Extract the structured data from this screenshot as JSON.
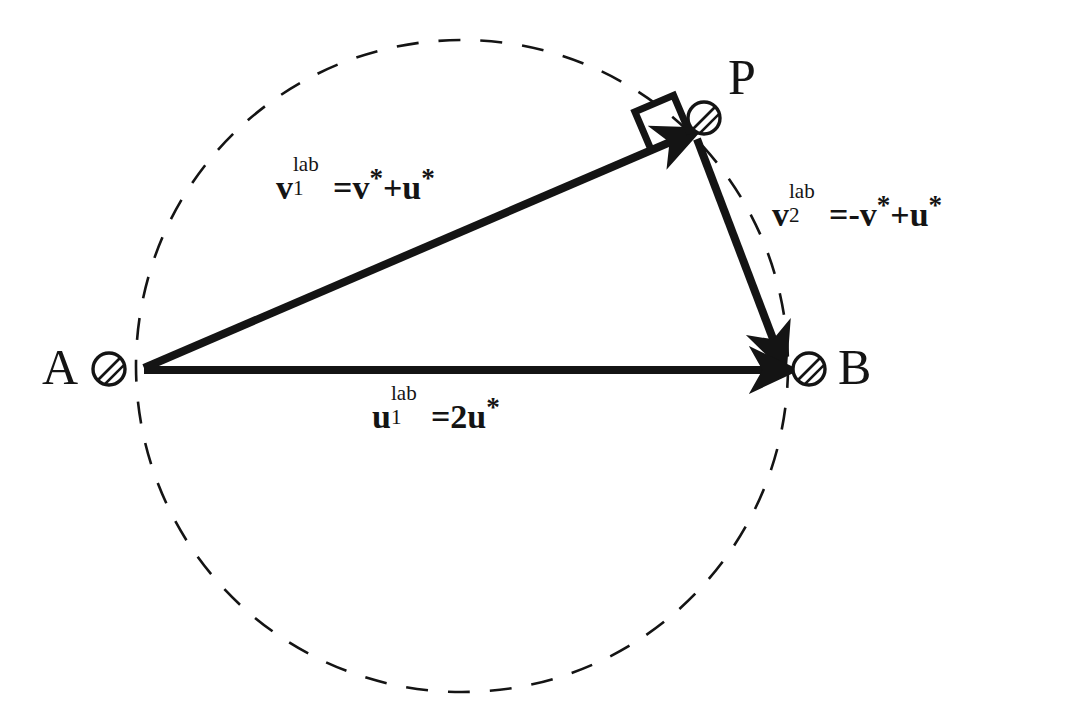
{
  "figure": {
    "background_color": "#ffffff",
    "ink_color": "#141414"
  },
  "points": [
    {
      "id": "A",
      "label": "A",
      "marker": "hatched-ball-icon",
      "label_x": 42,
      "label_y": 342,
      "marker_cx": 109,
      "marker_cy": 369,
      "marker_r": 16
    },
    {
      "id": "P",
      "label": "P",
      "marker": "hatched-ball-icon",
      "label_x": 728,
      "label_y": 52,
      "marker_cx": 704,
      "marker_cy": 118,
      "marker_r": 16
    },
    {
      "id": "B",
      "label": "B",
      "marker": "hatched-ball-icon",
      "label_x": 838,
      "label_y": 342,
      "marker_cx": 809,
      "marker_cy": 369,
      "marker_r": 16
    }
  ],
  "circle": {
    "name": "dashed-construction-circle",
    "cx": 462,
    "cy": 366,
    "r": 326,
    "style": "dashed",
    "stroke_width": 2.6,
    "dash": "22 20"
  },
  "vectors": [
    {
      "id": "v1",
      "name": "vector-v1-lab",
      "from": "A",
      "to": "P",
      "x1": 144,
      "y1": 368,
      "x2": 690,
      "y2": 133,
      "stroke_width": 8,
      "arrow": "end"
    },
    {
      "id": "v2",
      "name": "vector-v2-lab",
      "from": "P",
      "to": "B",
      "x1": 699,
      "y1": 139,
      "x2": 781,
      "y2": 360,
      "stroke_width": 8,
      "arrow": "end"
    },
    {
      "id": "u1",
      "name": "vector-u1-lab",
      "from": "A",
      "to": "B",
      "x1": 144,
      "y1": 370,
      "x2": 783,
      "y2": 370,
      "stroke_width": 8,
      "arrow": "end"
    }
  ],
  "right_angle": {
    "name": "right-angle-marker",
    "vertex_x": 690,
    "vertex_y": 134,
    "size": 40,
    "stroke_width": 7,
    "angle_deg": 23
  },
  "equations": [
    {
      "id": "eq-v1",
      "name": "equation-v1-lab",
      "x": 276,
      "y": 165,
      "symbol": "v",
      "sup": "lab",
      "sub": "1",
      "equals": "=",
      "rhs": "v*+u*",
      "plain": "v1lab=v*+u*"
    },
    {
      "id": "eq-v2",
      "name": "equation-v2-lab",
      "x": 772,
      "y": 192,
      "symbol": "v",
      "sup": "lab",
      "sub": "2",
      "equals": "=",
      "rhs": "-v*+u*",
      "plain": "v2lab=-v*+u*"
    },
    {
      "id": "eq-u1",
      "name": "equation-u1-lab",
      "x": 372,
      "y": 394,
      "symbol": "u",
      "sup": "lab",
      "sub": "1",
      "equals": "=",
      "rhs": "2u*",
      "plain": "u1lab=2u*"
    }
  ],
  "glyphs": {
    "minus": "-",
    "plus": "+",
    "equals": "=",
    "star": "*",
    "two": "2",
    "v": "v",
    "u": "u",
    "lab": "lab"
  }
}
